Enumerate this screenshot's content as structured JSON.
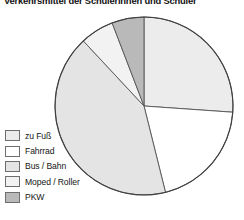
{
  "chart_title": "Verkehrsmittel der Schülerinnen und Schüler",
  "legend": {
    "items": [
      {
        "label": "zu Fuß",
        "color": "#ececec",
        "swatch_name": "legend-swatch-zu-fuss"
      },
      {
        "label": "Fahrrad",
        "color": "#ffffff",
        "swatch_name": "legend-swatch-fahrrad"
      },
      {
        "label": "Bus / Bahn",
        "color": "#e4e4e4",
        "swatch_name": "legend-swatch-bus-bahn"
      },
      {
        "label": "Moped / Roller",
        "color": "#f2f2f2",
        "swatch_name": "legend-swatch-moped-roller"
      },
      {
        "label": "PKW",
        "color": "#b9b9b9",
        "swatch_name": "legend-swatch-pkw"
      }
    ]
  },
  "chart_data": {
    "type": "pie",
    "title": "Verkehrsmittel der Schülerinnen und Schüler",
    "xlabel": "",
    "ylabel": "",
    "legend_position": "bottom-left",
    "grid": false,
    "start_angle_deg": 0,
    "direction": "clockwise",
    "categories": [
      "zu Fuß",
      "Fahrrad",
      "Bus / Bahn",
      "Moped / Roller",
      "PKW"
    ],
    "values": [
      26,
      20,
      42,
      6,
      6
    ],
    "unit": "%",
    "slices": [
      {
        "label": "zu Fuß",
        "value": 26,
        "color": "#ececec",
        "start_deg": 0,
        "end_deg": 94
      },
      {
        "label": "Fahrrad",
        "value": 20,
        "color": "#ffffff",
        "start_deg": 94,
        "end_deg": 166
      },
      {
        "label": "Bus / Bahn",
        "value": 42,
        "color": "#e4e4e4",
        "start_deg": 166,
        "end_deg": 317
      },
      {
        "label": "Moped / Roller",
        "value": 6,
        "color": "#f2f2f2",
        "start_deg": 317,
        "end_deg": 339
      },
      {
        "label": "PKW",
        "value": 6,
        "color": "#b9b9b9",
        "start_deg": 339,
        "end_deg": 360
      }
    ],
    "geometry": {
      "cx": 144,
      "cy": 106,
      "r": 89
    },
    "stroke_color": "#555555"
  }
}
